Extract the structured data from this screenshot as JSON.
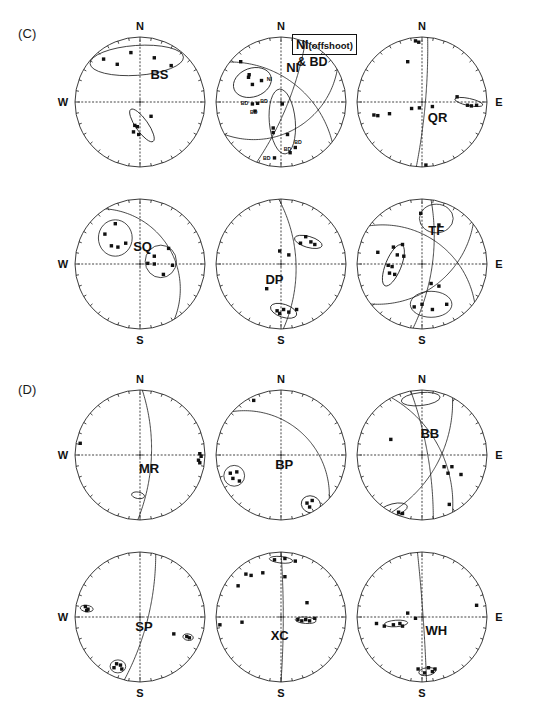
{
  "figure": {
    "width": 540,
    "height": 711,
    "background": "#ffffff",
    "ink_color": "#1a1a1a"
  },
  "panels": [
    {
      "id": "C",
      "tag": "(C)",
      "tag_x": 18,
      "tag_y": 26
    },
    {
      "id": "D",
      "tag": "(D)",
      "tag_y": 382,
      "tag_x": 18
    }
  ],
  "annotation": {
    "box_text_main": "NI",
    "box_text_paren": "(offshoot)",
    "sub_text": "& BD",
    "box_x": 292,
    "box_y": 34,
    "sub_x": 297,
    "sub_y": 55
  },
  "cardinals": {
    "north": "N",
    "south": "S",
    "west": "W",
    "east": "E"
  },
  "geometry": {
    "radius": 65,
    "centers_x": [
      140,
      281,
      422
    ],
    "centers_y": [
      102,
      264,
      455,
      617
    ],
    "tick_count": 36,
    "axis_dot_count": 18
  },
  "chart_data": {
    "type": "scatter",
    "projection": "lower-hemisphere equal-area stereonet",
    "xlabel": "",
    "ylabel": "",
    "grid": "dotted W-E and N-S axis with marginal degree ticks",
    "legend": "none",
    "nets": [
      {
        "label": "BS",
        "row": 0,
        "col": 0,
        "label_pos": [
          0.3,
          0.36
        ],
        "cardinals": [
          "N",
          "W"
        ],
        "points": [
          [
            -0.56,
            0.66
          ],
          [
            -0.35,
            0.58
          ],
          [
            -0.14,
            0.76
          ],
          [
            0.22,
            0.68
          ],
          [
            0.48,
            0.56
          ],
          [
            0.17,
            -0.22
          ],
          [
            -0.08,
            -0.36
          ],
          [
            -0.04,
            -0.38
          ],
          [
            -0.1,
            -0.46
          ],
          [
            -0.02,
            -0.5
          ]
        ],
        "contours": [
          {
            "type": "lens",
            "cx": -0.05,
            "cy": 0.64,
            "rx": 0.72,
            "ry": 0.23,
            "rot": 4
          },
          {
            "type": "lens",
            "cx": 0.03,
            "cy": -0.36,
            "rx": 0.3,
            "ry": 0.095,
            "rot": -55
          }
        ],
        "arcs": []
      },
      {
        "label": "NI",
        "row": 0,
        "col": 1,
        "label_pos": [
          0.18,
          0.46
        ],
        "cardinals": [
          "N"
        ],
        "points": [
          [
            -0.62,
            0.62
          ],
          [
            -0.5,
            0.38
          ],
          [
            -0.49,
            0.42
          ],
          [
            -0.44,
            0.27
          ],
          [
            -0.3,
            0.33
          ],
          [
            -0.36,
            -0.02
          ],
          [
            -0.44,
            -0.03
          ],
          [
            -0.4,
            -0.14
          ],
          [
            0.02,
            -0.03
          ],
          [
            -0.12,
            -0.4
          ],
          [
            -0.12,
            -0.47
          ],
          [
            0.1,
            -0.5
          ],
          [
            0.22,
            -0.7
          ],
          [
            0.14,
            -0.78
          ],
          [
            -0.1,
            -0.86
          ]
        ],
        "contours": [
          {
            "type": "lens",
            "cx": -0.44,
            "cy": 0.3,
            "rx": 0.3,
            "ry": 0.22,
            "rot": 20
          },
          {
            "type": "lens",
            "cx": 0.02,
            "cy": -0.3,
            "rx": 0.2,
            "ry": 0.5,
            "rot": 5
          }
        ],
        "arcs": [
          {
            "k": "gc",
            "strike": 38,
            "dip": 52
          },
          {
            "k": "gc",
            "strike": 150,
            "dip": 40
          },
          {
            "k": "gc",
            "strike": 112,
            "dip": 78
          }
        ],
        "bd_labels": [
          {
            "t": "BD",
            "x": -0.56,
            "y": -0.02
          },
          {
            "t": "BD",
            "x": -0.26,
            "y": 0.02
          },
          {
            "t": "BD",
            "x": -0.42,
            "y": -0.16
          },
          {
            "t": "BD",
            "x": 0.26,
            "y": -0.62
          },
          {
            "t": "BD",
            "x": 0.1,
            "y": -0.72
          },
          {
            "t": "BD",
            "x": -0.22,
            "y": -0.86
          }
        ],
        "ni_tag": {
          "t": "NI",
          "x": -0.18,
          "y": 0.36
        }
      },
      {
        "label": "QR",
        "row": 0,
        "col": 2,
        "label_pos": [
          0.24,
          -0.3
        ],
        "cardinals": [
          "N",
          "E"
        ],
        "points": [
          [
            -0.1,
            0.94
          ],
          [
            -0.05,
            0.92
          ],
          [
            -0.22,
            0.62
          ],
          [
            -0.74,
            -0.2
          ],
          [
            -0.68,
            -0.21
          ],
          [
            -0.5,
            -0.18
          ],
          [
            -0.16,
            -0.1
          ],
          [
            -0.04,
            -0.09
          ],
          [
            0.16,
            -0.07
          ],
          [
            0.54,
            0.08
          ],
          [
            0.7,
            -0.05
          ],
          [
            0.76,
            -0.06
          ],
          [
            0.84,
            -0.05
          ],
          [
            0.06,
            -0.97
          ]
        ],
        "contours": [
          {
            "type": "lens",
            "cx": 0.72,
            "cy": 0.0,
            "rx": 0.22,
            "ry": 0.055,
            "rot": -12
          }
        ],
        "arcs": [
          {
            "k": "gc",
            "strike": 95,
            "dip": 84
          }
        ]
      },
      {
        "label": "SQ",
        "row": 1,
        "col": 0,
        "label_pos": [
          0.04,
          0.2
        ],
        "cardinals": [
          "W",
          "S"
        ],
        "points": [
          [
            -0.38,
            0.62
          ],
          [
            -0.54,
            0.46
          ],
          [
            -0.44,
            0.28
          ],
          [
            -0.34,
            0.26
          ],
          [
            -0.22,
            0.32
          ],
          [
            0.44,
            0.24
          ],
          [
            0.22,
            0.12
          ],
          [
            0.12,
            0.01
          ],
          [
            0.22,
            0.0
          ],
          [
            0.5,
            -0.02
          ],
          [
            0.36,
            -0.16
          ]
        ],
        "contours": [
          {
            "type": "lens",
            "cx": -0.38,
            "cy": 0.4,
            "rx": 0.26,
            "ry": 0.28,
            "rot": 0
          },
          {
            "type": "lens",
            "cx": 0.32,
            "cy": 0.04,
            "rx": 0.24,
            "ry": 0.25,
            "rot": 0
          }
        ],
        "arcs": [
          {
            "k": "gc",
            "strike": 58,
            "dip": 36
          }
        ]
      },
      {
        "label": "DP",
        "row": 1,
        "col": 1,
        "label_pos": [
          -0.1,
          -0.3
        ],
        "cardinals": [
          "S"
        ],
        "points": [
          [
            0.38,
            0.42
          ],
          [
            0.3,
            0.32
          ],
          [
            0.46,
            0.34
          ],
          [
            0.52,
            0.3
          ],
          [
            -0.02,
            0.2
          ],
          [
            0.12,
            0.14
          ],
          [
            -0.22,
            -0.38
          ],
          [
            -0.06,
            -0.72
          ],
          [
            -0.02,
            -0.76
          ],
          [
            0.04,
            -0.7
          ],
          [
            0.12,
            -0.74
          ],
          [
            0.24,
            -0.7
          ]
        ],
        "contours": [
          {
            "type": "lens",
            "cx": 0.42,
            "cy": 0.34,
            "rx": 0.22,
            "ry": 0.085,
            "rot": -16
          },
          {
            "type": "lens",
            "cx": 0.04,
            "cy": -0.72,
            "rx": 0.21,
            "ry": 0.1,
            "rot": -18
          }
        ],
        "arcs": [
          {
            "k": "gc",
            "strike": 88,
            "dip": 64
          }
        ]
      },
      {
        "label": "TF",
        "row": 1,
        "col": 2,
        "label_pos": [
          0.22,
          0.44
        ],
        "cardinals": [
          "E",
          "S"
        ],
        "points": [
          [
            -0.02,
            0.78
          ],
          [
            0.26,
            0.6
          ],
          [
            -0.44,
            0.26
          ],
          [
            -0.3,
            0.3
          ],
          [
            -0.68,
            0.18
          ],
          [
            -0.38,
            0.14
          ],
          [
            -0.28,
            0.12
          ],
          [
            -0.52,
            -0.02
          ],
          [
            -0.46,
            -0.04
          ],
          [
            -0.5,
            -0.14
          ],
          [
            -0.42,
            -0.16
          ],
          [
            0.14,
            -0.3
          ],
          [
            0.26,
            -0.34
          ],
          [
            -0.12,
            -0.66
          ],
          [
            0.0,
            -0.62
          ],
          [
            0.16,
            -0.7
          ],
          [
            0.38,
            -0.62
          ]
        ],
        "contours": [
          {
            "type": "lens",
            "cx": -0.44,
            "cy": -0.02,
            "rx": 0.12,
            "ry": 0.34,
            "rot": -22
          },
          {
            "type": "lens",
            "cx": 0.22,
            "cy": 0.7,
            "rx": 0.26,
            "ry": 0.22,
            "rot": 0
          },
          {
            "type": "lens",
            "cx": 0.14,
            "cy": -0.62,
            "rx": 0.32,
            "ry": 0.2,
            "rot": 0
          }
        ],
        "arcs": [
          {
            "k": "gc",
            "strike": 98,
            "dip": 72
          },
          {
            "k": "gc",
            "strike": 142,
            "dip": 48
          },
          {
            "k": "gc",
            "strike": 36,
            "dip": 46
          }
        ]
      },
      {
        "label": "MR",
        "row": 2,
        "col": 0,
        "label_pos": [
          0.14,
          -0.28
        ],
        "cardinals": [
          "N",
          "W"
        ],
        "points": [
          [
            -0.92,
            0.18
          ],
          [
            0.92,
            0.02
          ],
          [
            0.94,
            -0.02
          ],
          [
            0.9,
            -0.08
          ],
          [
            0.92,
            -0.12
          ]
        ],
        "contours": [
          {
            "type": "lens",
            "cx": -0.03,
            "cy": -0.62,
            "rx": 0.1,
            "ry": 0.05,
            "rot": -10
          }
        ],
        "arcs": [
          {
            "k": "gc",
            "strike": 92,
            "dip": 70
          }
        ]
      },
      {
        "label": "BP",
        "row": 2,
        "col": 1,
        "label_pos": [
          0.05,
          -0.22
        ],
        "cardinals": [
          "N"
        ],
        "points": [
          [
            -0.42,
            0.84
          ],
          [
            -0.78,
            -0.28
          ],
          [
            -0.68,
            -0.26
          ],
          [
            -0.74,
            -0.36
          ],
          [
            -0.64,
            -0.4
          ],
          [
            0.4,
            -0.74
          ],
          [
            0.48,
            -0.7
          ],
          [
            0.44,
            -0.8
          ]
        ],
        "contours": [
          {
            "type": "lens",
            "cx": -0.72,
            "cy": -0.32,
            "rx": 0.16,
            "ry": 0.16,
            "rot": 0
          },
          {
            "type": "lens",
            "cx": 0.46,
            "cy": -0.76,
            "rx": 0.15,
            "ry": 0.13,
            "rot": -20
          }
        ],
        "arcs": [
          {
            "k": "gc",
            "strike": 42,
            "dip": 40
          }
        ]
      },
      {
        "label": "BB",
        "row": 2,
        "col": 2,
        "label_pos": [
          0.12,
          0.26
        ],
        "cardinals": [
          "N",
          "E"
        ],
        "points": [
          [
            -0.48,
            0.24
          ],
          [
            0.34,
            -0.18
          ],
          [
            0.46,
            -0.18
          ],
          [
            0.4,
            -0.28
          ],
          [
            0.6,
            -0.3
          ],
          [
            0.42,
            -0.76
          ],
          [
            -0.36,
            -0.88
          ],
          [
            -0.3,
            -0.9
          ]
        ],
        "contours": [
          {
            "type": "lens",
            "cx": -0.02,
            "cy": 0.86,
            "rx": 0.3,
            "ry": 0.1,
            "rot": 6
          },
          {
            "type": "lens",
            "cx": -0.44,
            "cy": -0.84,
            "rx": 0.22,
            "ry": 0.09,
            "rot": 14
          }
        ],
        "arcs": [
          {
            "k": "gc",
            "strike": 62,
            "dip": 58
          },
          {
            "k": "gc",
            "strike": 118,
            "dip": 60
          },
          {
            "k": "gc",
            "strike": 80,
            "dip": 80
          }
        ]
      },
      {
        "label": "SP",
        "row": 3,
        "col": 0,
        "label_pos": [
          0.06,
          -0.22
        ],
        "cardinals": [
          "W",
          "S"
        ],
        "points": [
          [
            -0.84,
            0.16
          ],
          [
            -0.82,
            0.1
          ],
          [
            -0.8,
            0.12
          ],
          [
            0.52,
            -0.26
          ],
          [
            0.72,
            -0.3
          ],
          [
            0.76,
            -0.32
          ],
          [
            -0.36,
            -0.72
          ],
          [
            -0.3,
            -0.74
          ],
          [
            -0.4,
            -0.78
          ],
          [
            -0.28,
            -0.8
          ]
        ],
        "contours": [
          {
            "type": "lens",
            "cx": -0.82,
            "cy": 0.13,
            "rx": 0.1,
            "ry": 0.05,
            "rot": -8
          },
          {
            "type": "lens",
            "cx": -0.34,
            "cy": -0.76,
            "rx": 0.12,
            "ry": 0.1,
            "rot": 0
          },
          {
            "type": "lens",
            "cx": 0.74,
            "cy": -0.31,
            "rx": 0.08,
            "ry": 0.05,
            "rot": -10
          }
        ],
        "arcs": [
          {
            "k": "gc",
            "strike": 104,
            "dip": 76
          }
        ]
      },
      {
        "label": "XC",
        "row": 3,
        "col": 1,
        "label_pos": [
          -0.02,
          -0.36
        ],
        "cardinals": [
          "S"
        ],
        "points": [
          [
            -0.1,
            0.88
          ],
          [
            0.06,
            0.9
          ],
          [
            0.22,
            0.86
          ],
          [
            -0.54,
            0.66
          ],
          [
            -0.46,
            0.64
          ],
          [
            -0.28,
            0.68
          ],
          [
            0.06,
            0.62
          ],
          [
            -0.66,
            0.48
          ],
          [
            0.4,
            0.22
          ],
          [
            -0.94,
            -0.12
          ],
          [
            -0.6,
            -0.08
          ],
          [
            0.26,
            -0.04
          ],
          [
            0.32,
            -0.06
          ],
          [
            0.38,
            -0.04
          ],
          [
            0.44,
            -0.06
          ],
          [
            0.52,
            -0.02
          ]
        ],
        "contours": [
          {
            "type": "lens",
            "cx": 0.0,
            "cy": 0.88,
            "rx": 0.18,
            "ry": 0.05,
            "rot": -6
          },
          {
            "type": "lens",
            "cx": 0.38,
            "cy": -0.05,
            "rx": 0.16,
            "ry": 0.05,
            "rot": -4
          }
        ],
        "arcs": [
          {
            "k": "gc",
            "strike": 90,
            "dip": 86
          }
        ]
      },
      {
        "label": "WH",
        "row": 3,
        "col": 2,
        "label_pos": [
          0.22,
          -0.28
        ],
        "cardinals": [
          "E",
          "S"
        ],
        "points": [
          [
            -0.7,
            -0.1
          ],
          [
            -0.58,
            -0.14
          ],
          [
            -0.44,
            -0.12
          ],
          [
            -0.34,
            -0.1
          ],
          [
            -0.3,
            -0.14
          ],
          [
            -0.22,
            0.06
          ],
          [
            -0.1,
            -0.02
          ],
          [
            0.84,
            0.18
          ],
          [
            -0.06,
            -0.8
          ],
          [
            0.1,
            -0.78
          ],
          [
            0.04,
            -0.86
          ],
          [
            0.16,
            -0.84
          ],
          [
            0.2,
            -0.8
          ]
        ],
        "contours": [
          {
            "type": "lens",
            "cx": -0.4,
            "cy": -0.1,
            "rx": 0.18,
            "ry": 0.05,
            "rot": 4
          },
          {
            "type": "lens",
            "cx": 0.08,
            "cy": -0.84,
            "rx": 0.13,
            "ry": 0.06,
            "rot": 8
          }
        ],
        "arcs": [
          {
            "k": "gc",
            "strike": 86,
            "dip": 88
          }
        ]
      }
    ]
  }
}
